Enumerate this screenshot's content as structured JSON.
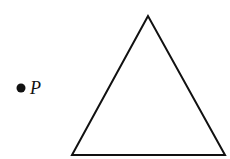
{
  "diagram": {
    "point": {
      "label": "P",
      "x": 21,
      "y": 88,
      "radius": 4.5,
      "color": "#111111"
    },
    "triangle": {
      "vertices": [
        [
          148,
          16
        ],
        [
          72,
          155
        ],
        [
          225,
          155
        ]
      ],
      "stroke": "#111111",
      "stroke_width": 2,
      "fill": "none"
    }
  }
}
